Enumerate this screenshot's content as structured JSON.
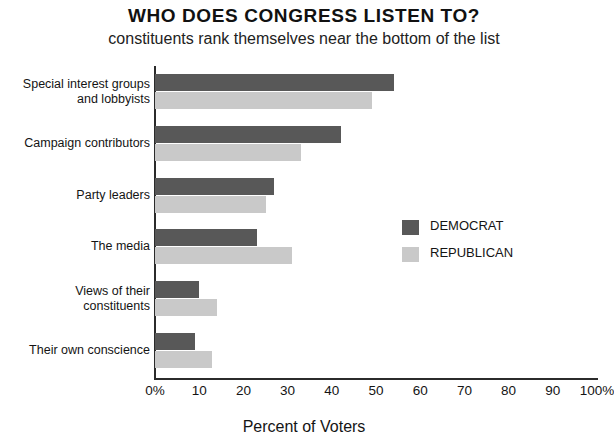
{
  "chart_data": {
    "type": "bar",
    "orientation": "horizontal",
    "title": "WHO DOES CONGRESS LISTEN TO?",
    "subtitle": "constituents rank themselves near the bottom of the list",
    "xlabel": "Percent of Voters",
    "ylabel": "",
    "xlim": [
      0,
      100
    ],
    "grid": false,
    "legend_position": "inside-right",
    "categories": [
      "Special interest groups and lobbyists",
      "Campaign contributors",
      "Party leaders",
      "The media",
      "Views of their constituents",
      "Their own conscience"
    ],
    "category_lines": [
      [
        "Special interest groups",
        "and lobbyists"
      ],
      [
        "Campaign contributors"
      ],
      [
        "Party leaders"
      ],
      [
        "The media"
      ],
      [
        "Views of their",
        "constituents"
      ],
      [
        "Their own conscience"
      ]
    ],
    "series": [
      {
        "name": "DEMOCRAT",
        "color": "#585858",
        "values": [
          54,
          42,
          27,
          23,
          10,
          9
        ]
      },
      {
        "name": "REPUBLICAN",
        "color": "#c9c9c9",
        "values": [
          49,
          33,
          25,
          31,
          14,
          13
        ]
      }
    ],
    "xticks": [
      {
        "value": 0,
        "label": "0%"
      },
      {
        "value": 10,
        "label": "10"
      },
      {
        "value": 20,
        "label": "20"
      },
      {
        "value": 30,
        "label": "30"
      },
      {
        "value": 40,
        "label": "40"
      },
      {
        "value": 50,
        "label": "50"
      },
      {
        "value": 60,
        "label": "60"
      },
      {
        "value": 70,
        "label": "70"
      },
      {
        "value": 80,
        "label": "80"
      },
      {
        "value": 90,
        "label": "90"
      },
      {
        "value": 100,
        "label": "100%"
      }
    ]
  }
}
